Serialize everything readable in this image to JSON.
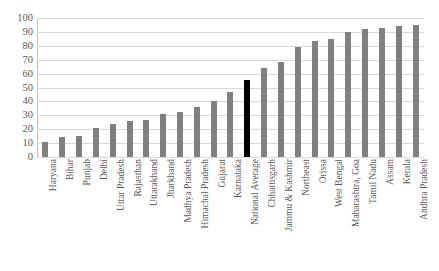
{
  "chart_data": {
    "type": "bar",
    "title": "",
    "subtitle": "",
    "xlabel": "",
    "ylabel": "",
    "ylim": [
      0,
      100
    ],
    "ytick_step": 10,
    "yticks": [
      0,
      10,
      20,
      30,
      40,
      50,
      60,
      70,
      80,
      90,
      100
    ],
    "ytick_labels": [
      "0",
      "10",
      "20",
      "30",
      "40",
      "50",
      "60",
      "70",
      "80",
      "90",
      "100"
    ],
    "grid": true,
    "legend": false,
    "legend_position": "none",
    "bar_color": "#808080",
    "highlight_color": "#000000",
    "highlight_category": "National Average",
    "categories": [
      "Haryana",
      "Bihar",
      "Punjab",
      "Delhi",
      "Uttar Pradesh",
      "Rajasthan",
      "Uttarakhand",
      "Jharkhand",
      "Madhya Pradesh",
      "Himachal Pradesh",
      "Gujarat",
      "Karnataka",
      "National Average",
      "Chhattisgarh",
      "Jammu & Kashmir",
      "Northeast",
      "Orissa",
      "West Bengal",
      "Maharashtra, Goa",
      "Tamil Nadu",
      "Assam",
      "Kerala",
      "Andhra Pradesh"
    ],
    "values": [
      11,
      14.5,
      15,
      21,
      24,
      26,
      26.5,
      31,
      32.5,
      36,
      40,
      47,
      55.5,
      64,
      68.5,
      79,
      83.5,
      85,
      90,
      92,
      92.5,
      94.5,
      95
    ]
  }
}
